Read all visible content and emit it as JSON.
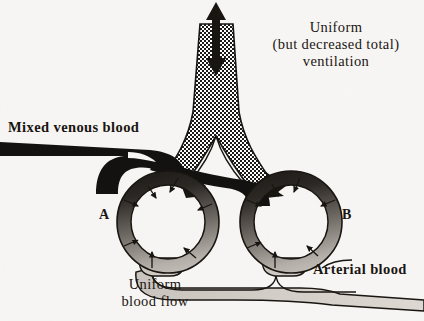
{
  "figure": {
    "title_text_absent": "",
    "background_color": "#f7f6f4",
    "ink_color": "#17130f",
    "labels": {
      "ventilation": "Uniform\n(but decreased total)\nventilation",
      "mixed_venous_blood": "Mixed venous blood",
      "uniform_blood_flow": "Uniform\nblood flow",
      "arterial_blood": "Arterial blood",
      "alveolus_a": "A",
      "alveolus_b": "B"
    },
    "colors": {
      "venous_blood": "#12100e",
      "arterial_blood": "#cfcac4",
      "airway_stipple_dark": "#1a1714",
      "airway_stipple_light": "#ffffff",
      "capillary_gradient_start": "#15120f",
      "capillary_gradient_end": "#d8d3cd",
      "paper": "#f7f6f4"
    },
    "airway": {
      "name": "trachea-and-bronchi",
      "fill_pattern": "checkerboard-stipple",
      "ventilation_arrow": "double-headed-vertical",
      "branches": 2
    },
    "alveoli": [
      {
        "id": "A",
        "cx": 168,
        "cy": 222,
        "r_outer": 51,
        "r_inner": 37,
        "inward_arrows": 7,
        "bronchus_arrow": "down-left-into-A"
      },
      {
        "id": "B",
        "cx": 291,
        "cy": 222,
        "r_outer": 51,
        "r_inner": 37,
        "inward_arrows": 7,
        "bronchus_arrow": "down-left-into-B"
      }
    ],
    "vessels": {
      "inflow": {
        "name": "mixed-venous-trunk",
        "shade": "black",
        "enters_from": "left"
      },
      "outflow": {
        "name": "arterial-trunk",
        "shade": "light-gray",
        "exits_to": "right"
      }
    }
  }
}
